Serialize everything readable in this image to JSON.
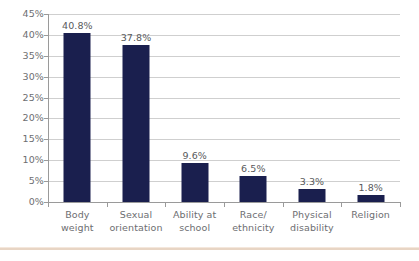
{
  "chart_data": {
    "type": "bar",
    "title": "",
    "subtitle": "",
    "xlabel": "",
    "ylabel": "",
    "categories": [
      "Body weight",
      "Sexual orientation",
      "Ability at school",
      "Race/ ethnicity",
      "Physical disability",
      "Religion"
    ],
    "category_lines": [
      [
        "Body",
        "weight"
      ],
      [
        "Sexual",
        "orientation"
      ],
      [
        "Ability at",
        "school"
      ],
      [
        "Race/",
        "ethnicity"
      ],
      [
        "Physical",
        "disability"
      ],
      [
        "Religion"
      ]
    ],
    "values": [
      40.8,
      37.8,
      9.6,
      6.5,
      3.3,
      1.8
    ],
    "value_labels": [
      "40.8%",
      "37.8%",
      "9.6%",
      "6.5%",
      "3.3%",
      "1.8%"
    ],
    "ylim": [
      0,
      45
    ],
    "ytick_values": [
      45,
      40,
      35,
      30,
      25,
      20,
      15,
      10,
      5,
      0
    ],
    "ytick_labels": [
      "45%",
      "40%",
      "35%",
      "30%",
      "25%",
      "20%",
      "15%",
      "10%",
      "5%",
      "0%"
    ],
    "grid": true,
    "legend": false,
    "legend_position": "none",
    "colors": {
      "bar": "#1a1f4e",
      "gridline": "#cfcfcf",
      "axis": "#9a9a9a",
      "tick_label": "#6d6e71",
      "value_label": "#58595b",
      "background": "#ffffff",
      "bottom_rule": "#e8d5c4"
    }
  }
}
